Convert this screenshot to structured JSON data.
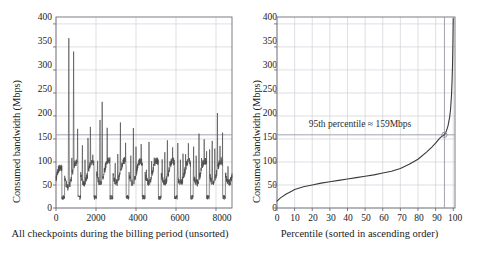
{
  "figure": {
    "background": "#ffffff",
    "line_color": "#4a4a4a",
    "grid_color": "#c9c9d4",
    "frame_color": "#6e6e78",
    "threshold_color": "#9a9aa6"
  },
  "chart_data": [
    {
      "id": "left",
      "type": "line",
      "title": "",
      "xlabel": "All checkpoints during the billing period (unsorted)",
      "ylabel": "Consumed bandwidth (Mbps)",
      "xlim": [
        0,
        8800
      ],
      "ylim": [
        0,
        415
      ],
      "xticks": [
        0,
        2000,
        4000,
        6000,
        8000
      ],
      "xticklabels": [
        "0",
        "2000",
        "4000",
        "6000",
        "8000"
      ],
      "yticks": [
        0,
        50,
        100,
        150,
        200,
        250,
        300,
        350,
        400
      ],
      "yticklabels": [
        "0",
        "50",
        "100",
        "150",
        "200",
        "250",
        "300",
        "350",
        "400"
      ],
      "grid": true,
      "legend": "none",
      "threshold_line": 159,
      "units": "Mbps",
      "note": "Dense unsorted time-series of ~8700 checkpoints; oscillating band roughly 15-100 Mbps with periodic spikes; largest spikes 392 and 348 near x=650-900.",
      "series": [
        {
          "name": "Consumed bandwidth",
          "x_count": 8700,
          "baseline_min": 12,
          "baseline_max": 100,
          "peaks": [
            {
              "x": 180,
              "y": 79
            },
            {
              "x": 300,
              "y": 26
            },
            {
              "x": 420,
              "y": 136
            },
            {
              "x": 520,
              "y": 63
            },
            {
              "x": 640,
              "y": 392
            },
            {
              "x": 700,
              "y": 17
            },
            {
              "x": 790,
              "y": 120
            },
            {
              "x": 880,
              "y": 348
            },
            {
              "x": 960,
              "y": 21
            },
            {
              "x": 1080,
              "y": 185
            },
            {
              "x": 1180,
              "y": 62
            },
            {
              "x": 1320,
              "y": 141
            },
            {
              "x": 1450,
              "y": 118
            },
            {
              "x": 1600,
              "y": 166
            },
            {
              "x": 1720,
              "y": 196
            },
            {
              "x": 1840,
              "y": 130
            },
            {
              "x": 1960,
              "y": 146
            },
            {
              "x": 2080,
              "y": 111
            },
            {
              "x": 2200,
              "y": 203
            },
            {
              "x": 2310,
              "y": 244
            },
            {
              "x": 2430,
              "y": 94
            },
            {
              "x": 2560,
              "y": 175
            },
            {
              "x": 2690,
              "y": 120
            },
            {
              "x": 2820,
              "y": 160
            },
            {
              "x": 2960,
              "y": 108
            },
            {
              "x": 3090,
              "y": 124
            },
            {
              "x": 3220,
              "y": 190
            },
            {
              "x": 3350,
              "y": 113
            },
            {
              "x": 3480,
              "y": 150
            },
            {
              "x": 3610,
              "y": 198
            },
            {
              "x": 3740,
              "y": 126
            },
            {
              "x": 3870,
              "y": 184
            },
            {
              "x": 4000,
              "y": 136
            },
            {
              "x": 4130,
              "y": 99
            },
            {
              "x": 4260,
              "y": 147
            },
            {
              "x": 4390,
              "y": 120
            },
            {
              "x": 4520,
              "y": 92
            },
            {
              "x": 4650,
              "y": 152
            },
            {
              "x": 4780,
              "y": 104
            },
            {
              "x": 4910,
              "y": 121
            },
            {
              "x": 5050,
              "y": 93
            },
            {
              "x": 5180,
              "y": 142
            },
            {
              "x": 5310,
              "y": 110
            },
            {
              "x": 5440,
              "y": 126
            },
            {
              "x": 5570,
              "y": 166
            },
            {
              "x": 5700,
              "y": 105
            },
            {
              "x": 5830,
              "y": 137
            },
            {
              "x": 5960,
              "y": 118
            },
            {
              "x": 6090,
              "y": 147
            },
            {
              "x": 6220,
              "y": 109
            },
            {
              "x": 6350,
              "y": 133
            },
            {
              "x": 6480,
              "y": 122
            },
            {
              "x": 6620,
              "y": 156
            },
            {
              "x": 6750,
              "y": 114
            },
            {
              "x": 6880,
              "y": 141
            },
            {
              "x": 7010,
              "y": 126
            },
            {
              "x": 7150,
              "y": 174
            },
            {
              "x": 7280,
              "y": 118
            },
            {
              "x": 7410,
              "y": 150
            },
            {
              "x": 7540,
              "y": 197
            },
            {
              "x": 7680,
              "y": 129
            },
            {
              "x": 7810,
              "y": 160
            },
            {
              "x": 7940,
              "y": 138
            },
            {
              "x": 8070,
              "y": 209
            },
            {
              "x": 8200,
              "y": 148
            },
            {
              "x": 8330,
              "y": 175
            },
            {
              "x": 8460,
              "y": 121
            },
            {
              "x": 8600,
              "y": 95
            }
          ]
        }
      ]
    },
    {
      "id": "right",
      "type": "line",
      "title": "",
      "xlabel": "Percentile (sorted in ascending order)",
      "ylabel": "Consumed bandwidth (Mbps)",
      "xlim": [
        0,
        101
      ],
      "ylim": [
        0,
        415
      ],
      "xticks": [
        0,
        10,
        20,
        30,
        40,
        50,
        60,
        70,
        80,
        90,
        100
      ],
      "xticklabels": [
        "0",
        "10",
        "20",
        "30",
        "40",
        "50",
        "60",
        "70",
        "80",
        "90",
        "100"
      ],
      "yticks": [
        0,
        50,
        100,
        150,
        200,
        250,
        300,
        350,
        400
      ],
      "yticklabels": [
        "0",
        "50",
        "100",
        "150",
        "200",
        "250",
        "300",
        "350",
        "400"
      ],
      "grid": true,
      "legend": "none",
      "annotation": "95th percentile ≈ 159Mbps",
      "marker_point": {
        "x": 95,
        "y": 159
      },
      "threshold_hline": 159,
      "threshold_vline": 95,
      "units": "Mbps",
      "series": [
        {
          "name": "Sorted consumed bandwidth (CDF)",
          "x": [
            0,
            2,
            5,
            8,
            10,
            15,
            20,
            25,
            30,
            35,
            40,
            45,
            50,
            55,
            60,
            65,
            70,
            75,
            80,
            85,
            88,
            90,
            92,
            93,
            94,
            95,
            96,
            97,
            98,
            98.5,
            99,
            99.3,
            99.6,
            99.8,
            100
          ],
          "y": [
            15,
            22,
            30,
            36,
            40,
            46,
            50,
            54,
            57,
            60,
            63,
            66,
            69,
            72,
            76,
            80,
            86,
            95,
            106,
            122,
            133,
            141,
            150,
            154,
            157,
            159,
            166,
            178,
            198,
            215,
            245,
            272,
            310,
            355,
            412
          ]
        }
      ]
    }
  ]
}
